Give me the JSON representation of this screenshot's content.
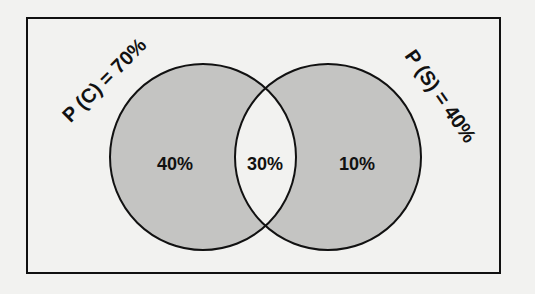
{
  "diagram": {
    "type": "venn",
    "sets": [
      {
        "name": "C",
        "label": "P (C) = 70%",
        "total_percent": 70
      },
      {
        "name": "S",
        "label": "P (S) = 40%",
        "total_percent": 40
      }
    ],
    "regions": {
      "c_only": "40%",
      "intersection": "30%",
      "s_only": "10%"
    },
    "colors": {
      "background": "#f2f2f0",
      "circle_fill": "#c4c4c2",
      "intersection_fill": "#f2f2f0",
      "stroke": "#111111"
    }
  }
}
